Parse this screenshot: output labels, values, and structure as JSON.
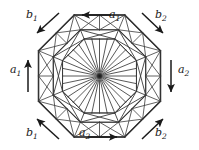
{
  "figure": {
    "type": "triangulated-octagon-fundamental-polygon",
    "background": "#ffffff",
    "line_color": "#3a3a3a",
    "outline_color": "#1d1d1d",
    "label_color": "#1a1a1a",
    "center_hub_color": "#222222"
  },
  "geometry": {
    "center": {
      "x": 99.5,
      "y": 76
    },
    "rings": [
      {
        "name": "outer-octagon",
        "radius": 66,
        "stroke_width": 1.5
      },
      {
        "name": "middle-octagon",
        "radius": 50,
        "stroke_width": 1.1
      },
      {
        "name": "inner-octagon",
        "radius": 40,
        "stroke_width": 1.0
      }
    ],
    "octagon_rotation_deg": 22.5,
    "fan_spokes": 32,
    "hub_radius": 4
  },
  "labels": [
    {
      "id": "b1-top-left",
      "base": "b",
      "sub": "1",
      "x": 26,
      "y": 9,
      "arrow": "down-left"
    },
    {
      "id": "a1-top",
      "base": "a",
      "sub": "1",
      "x": 109,
      "y": 9,
      "arrow": "left"
    },
    {
      "id": "b2-top-right",
      "base": "b",
      "sub": "2",
      "x": 155,
      "y": 9,
      "arrow": "down-right"
    },
    {
      "id": "a1-left",
      "base": "a",
      "sub": "1",
      "x": 10,
      "y": 64,
      "arrow": "up"
    },
    {
      "id": "a2-right",
      "base": "a",
      "sub": "2",
      "x": 178,
      "y": 64,
      "arrow": "down"
    },
    {
      "id": "b1-bottom-left",
      "base": "b",
      "sub": "1",
      "x": 26,
      "y": 127,
      "arrow": "up-left"
    },
    {
      "id": "a2-bottom",
      "base": "a",
      "sub": "2",
      "x": 79,
      "y": 127,
      "arrow": "right"
    },
    {
      "id": "b2-bottom-right",
      "base": "b",
      "sub": "2",
      "x": 155,
      "y": 127,
      "arrow": "up-right"
    }
  ],
  "arrows": [
    {
      "id": "arrow-b1-top-left",
      "x1": 59,
      "y1": 13,
      "x2": 37,
      "y2": 33,
      "head": "end"
    },
    {
      "id": "arrow-a1-top",
      "x1": 111,
      "y1": 15,
      "x2": 82,
      "y2": 15,
      "head": "end"
    },
    {
      "id": "arrow-b2-top-right",
      "x1": 142,
      "y1": 13,
      "x2": 163,
      "y2": 33,
      "head": "end"
    },
    {
      "id": "arrow-a1-left",
      "x1": 28,
      "y1": 92,
      "x2": 28,
      "y2": 60,
      "head": "end"
    },
    {
      "id": "arrow-a2-right",
      "x1": 171,
      "y1": 60,
      "x2": 171,
      "y2": 92,
      "head": "end"
    },
    {
      "id": "arrow-b1-bottom-left",
      "x1": 59,
      "y1": 139,
      "x2": 37,
      "y2": 119,
      "head": "end"
    },
    {
      "id": "arrow-a2-bottom",
      "x1": 88,
      "y1": 137,
      "x2": 117,
      "y2": 137,
      "head": "end"
    },
    {
      "id": "arrow-b2-bottom-right",
      "x1": 142,
      "y1": 139,
      "x2": 163,
      "y2": 119,
      "head": "end"
    }
  ]
}
